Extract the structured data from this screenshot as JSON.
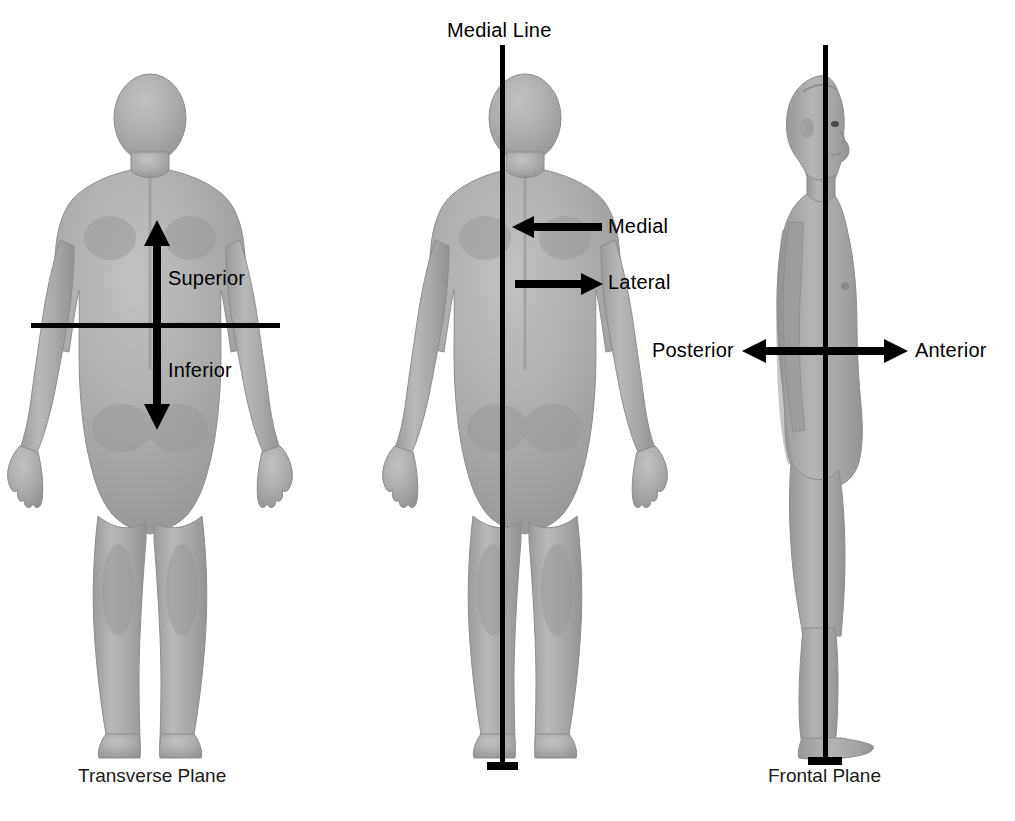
{
  "figure": {
    "background_color": "#ffffff",
    "body_fill": "#a9a9a9",
    "body_shade": "#9a9a9a",
    "body_highlight": "#bdbdbd",
    "line_color": "#000000"
  },
  "panels": [
    {
      "id": "transverse",
      "view": "posterior",
      "caption": "Transverse Plane",
      "plane_orientation": "horizontal",
      "labels": [
        {
          "text": "Superior",
          "arrow": "up"
        },
        {
          "text": "Inferior",
          "arrow": "down"
        }
      ]
    },
    {
      "id": "medial",
      "view": "posterior",
      "caption": "",
      "plane_orientation": "vertical",
      "line_label": "Medial Line",
      "labels": [
        {
          "text": "Medial",
          "arrow": "left"
        },
        {
          "text": "Lateral",
          "arrow": "right"
        }
      ]
    },
    {
      "id": "frontal",
      "view": "lateral",
      "caption": "Frontal Plane",
      "plane_orientation": "vertical",
      "labels": [
        {
          "text": "Posterior",
          "arrow": "left"
        },
        {
          "text": "Anterior",
          "arrow": "right"
        }
      ]
    }
  ],
  "labels": {
    "superior": "Superior",
    "inferior": "Inferior",
    "medial_line": "Medial Line",
    "medial": "Medial",
    "lateral": "Lateral",
    "posterior": "Posterior",
    "anterior": "Anterior",
    "transverse_plane": "Transverse Plane",
    "frontal_plane": "Frontal Plane"
  }
}
